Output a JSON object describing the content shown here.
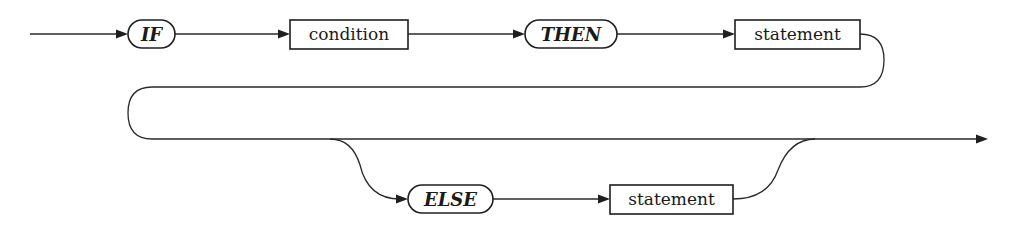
{
  "diagram": {
    "type": "syntax-diagram",
    "nodes": [
      {
        "id": "if",
        "kind": "terminal",
        "label": "IF"
      },
      {
        "id": "condition",
        "kind": "nonterminal",
        "label": "condition"
      },
      {
        "id": "then",
        "kind": "terminal",
        "label": "THEN"
      },
      {
        "id": "statement1",
        "kind": "nonterminal",
        "label": "statement"
      },
      {
        "id": "else",
        "kind": "terminal",
        "label": "ELSE"
      },
      {
        "id": "statement2",
        "kind": "nonterminal",
        "label": "statement"
      }
    ],
    "edges": [
      {
        "from": "start",
        "to": "if"
      },
      {
        "from": "if",
        "to": "condition"
      },
      {
        "from": "condition",
        "to": "then"
      },
      {
        "from": "then",
        "to": "statement1"
      },
      {
        "from": "statement1",
        "to": "end",
        "note": "wraps to second line"
      },
      {
        "from": "statement1",
        "to": "else",
        "note": "optional branch"
      },
      {
        "from": "else",
        "to": "statement2"
      },
      {
        "from": "statement2",
        "to": "end"
      }
    ],
    "colors": {
      "stroke": "#1f1f1f",
      "background": "#ffffff"
    }
  }
}
